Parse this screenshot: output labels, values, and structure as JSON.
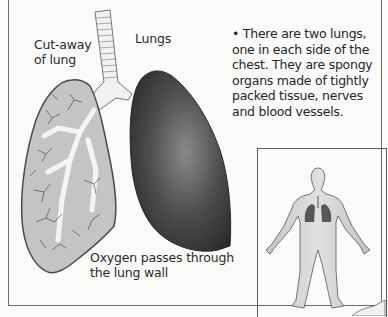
{
  "labels": {
    "cutaway": "Cut-away\nof lung",
    "cutaway_line1": "Cut-away",
    "cutaway_line2": "of lung",
    "lungs": "Lungs",
    "oxygen_line1": "Oxygen passes through",
    "oxygen_line2": "the lung wall"
  },
  "fact": {
    "bullet": "•",
    "text": "There are two lungs, one in each side of the chest. They are spongy organs made of tightly packed tissue, nerves and blood vessels."
  },
  "inset": {
    "description": "human-figure-with-lungs"
  },
  "colors": {
    "lung_cutaway_fill": "#c4c4c4",
    "lung_solid_dark": "#3a3a3a",
    "figure_fill": "#cfcfcf",
    "border": "#6b6b6b"
  }
}
